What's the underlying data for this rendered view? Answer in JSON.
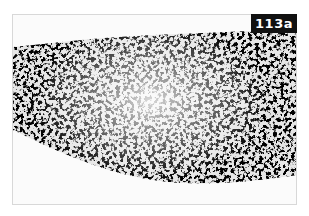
{
  "figure": {
    "label": "113a",
    "colors": {
      "background": "#ffffff",
      "frame_fill": "#fbfbfb",
      "stain_dark": "#2a2a2a",
      "stain_mid": "#8a8a8a",
      "label_bg": "#111111",
      "label_text": "#ffffff"
    }
  }
}
